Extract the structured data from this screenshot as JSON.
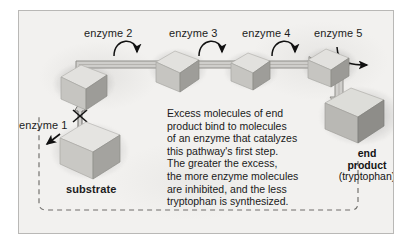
{
  "figure": {
    "background_color": "#f2f1ef",
    "border_color": "#b9b8b6"
  },
  "enzymes": [
    {
      "id": "enzyme-1",
      "label": "enzyme 1"
    },
    {
      "id": "enzyme-2",
      "label": "enzyme 2"
    },
    {
      "id": "enzyme-3",
      "label": "enzyme 3"
    },
    {
      "id": "enzyme-4",
      "label": "enzyme 4"
    },
    {
      "id": "enzyme-5",
      "label": "enzyme 5"
    }
  ],
  "molecules": {
    "substrate_label": "substrate",
    "end_product": {
      "line1": "end",
      "line2": "product",
      "line3": "(tryptophan)"
    }
  },
  "annotation": {
    "lines": [
      "Excess molecules of end",
      "product bind to molecules",
      "of an enzyme that catalyzes",
      "this pathway's first step.",
      "The greater the excess,",
      "the more enzyme molecules",
      "are inhibited, and the less",
      "tryptophan is synthesized."
    ]
  },
  "colors": {
    "cube_top": "#e4e3e0",
    "cube_left": "#c9c8c4",
    "cube_right": "#9e9d99",
    "arrow_fill": "#cfcecb",
    "arrow_stroke": "#8f8e8a",
    "catalysis_arrow": "#111111",
    "dashed_loop": "#6e6d6a",
    "text": "#1a1a1a"
  }
}
